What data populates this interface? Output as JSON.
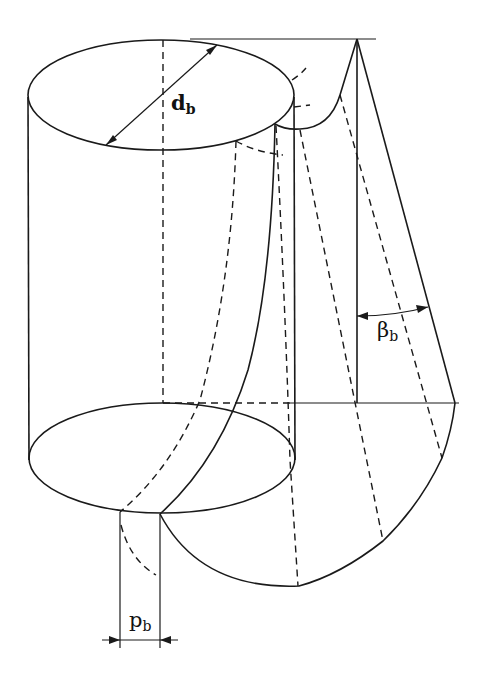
{
  "figure": {
    "labels": {
      "diameter": {
        "main": "d",
        "sub": "b"
      },
      "helix_angle": {
        "main": "β",
        "sub": "b"
      },
      "pitch": {
        "main": "p",
        "sub": "b"
      }
    },
    "colors": {
      "line": "#1a1a1a",
      "background": "#ffffff"
    }
  }
}
